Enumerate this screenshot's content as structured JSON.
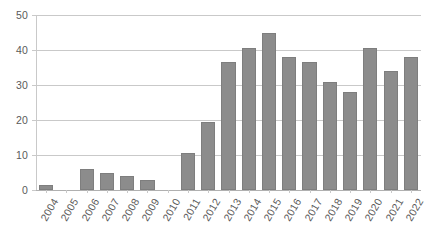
{
  "chart_data": {
    "type": "bar",
    "title": "",
    "subtitle": "",
    "xlabel": "",
    "ylabel": "",
    "categories": [
      "2004",
      "2005",
      "2006",
      "2007",
      "2008",
      "2009",
      "2010",
      "2011",
      "2012",
      "2013",
      "2014",
      "2015",
      "2016",
      "2017",
      "2018",
      "2019",
      "2020",
      "2021",
      "2022"
    ],
    "values": [
      1.5,
      0,
      6,
      5,
      4,
      3,
      0,
      10.5,
      19.5,
      36.5,
      40.5,
      45,
      38,
      36.5,
      31,
      28,
      40.5,
      34,
      38
    ],
    "series": [
      {
        "name": "",
        "values": [
          1.5,
          0,
          6,
          5,
          4,
          3,
          0,
          10.5,
          19.5,
          36.5,
          40.5,
          45,
          38,
          36.5,
          31,
          28,
          40.5,
          34,
          38
        ]
      }
    ],
    "ylim": [
      0,
      50
    ],
    "yticks": [
      0,
      10,
      20,
      30,
      40,
      50
    ],
    "ytick_labels": [
      "0",
      "10",
      "20",
      "30",
      "40",
      "50"
    ],
    "grid": true,
    "grid_axis": "y",
    "legend": false,
    "legend_position": "none",
    "annotations": [],
    "bar_color": "#8c8c8c",
    "bar_edge_color": "#7e7e7e",
    "grid_color": "#c9c9c9",
    "tick_label_color": "#5a5a5a",
    "background_color": "#ffffff",
    "xtick_rotation": -60
  }
}
